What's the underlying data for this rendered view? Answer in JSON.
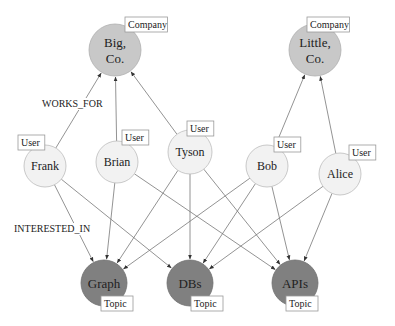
{
  "colors": {
    "company_fill": "#c8c8c8",
    "company_stroke": "#b0b0b0",
    "user_fill": "#f2f2f2",
    "user_stroke": "#bdbdbd",
    "topic_fill": "#808080",
    "topic_stroke": "#6e6e6e",
    "edge": "#777777"
  },
  "nodes": [
    {
      "id": "bigco",
      "lines": [
        "Big,",
        "Co."
      ],
      "type": "Company",
      "x": 115,
      "y": 50,
      "r": 26,
      "tag_x": 125,
      "tag_y": 17
    },
    {
      "id": "littleco",
      "lines": [
        "Little,",
        "Co."
      ],
      "type": "Company",
      "x": 315,
      "y": 50,
      "r": 26,
      "tag_x": 307,
      "tag_y": 17
    },
    {
      "id": "frank",
      "lines": [
        "Frank"
      ],
      "type": "User",
      "x": 45,
      "y": 166,
      "r": 21,
      "tag_x": 18,
      "tag_y": 135
    },
    {
      "id": "brian",
      "lines": [
        "Brian"
      ],
      "type": "User",
      "x": 117,
      "y": 162,
      "r": 21,
      "tag_x": 122,
      "tag_y": 130
    },
    {
      "id": "tyson",
      "lines": [
        "Tyson"
      ],
      "type": "User",
      "x": 190,
      "y": 152,
      "r": 22,
      "tag_x": 187,
      "tag_y": 121
    },
    {
      "id": "bob",
      "lines": [
        "Bob"
      ],
      "type": "User",
      "x": 267,
      "y": 166,
      "r": 21,
      "tag_x": 274,
      "tag_y": 137
    },
    {
      "id": "alice",
      "lines": [
        "Alice"
      ],
      "type": "User",
      "x": 340,
      "y": 174,
      "r": 21,
      "tag_x": 349,
      "tag_y": 145
    },
    {
      "id": "graph",
      "lines": [
        "Graph"
      ],
      "type": "Topic",
      "x": 104,
      "y": 283,
      "r": 23,
      "tag_x": 101,
      "tag_y": 296
    },
    {
      "id": "dbs",
      "lines": [
        "DBs"
      ],
      "type": "Topic",
      "x": 190,
      "y": 283,
      "r": 23,
      "tag_x": 191,
      "tag_y": 296
    },
    {
      "id": "apis",
      "lines": [
        "APIs"
      ],
      "type": "Topic",
      "x": 295,
      "y": 283,
      "r": 23,
      "tag_x": 286,
      "tag_y": 296
    }
  ],
  "edges": [
    {
      "from": "frank",
      "to": "bigco",
      "type": "WORKS_FOR"
    },
    {
      "from": "brian",
      "to": "bigco",
      "type": "WORKS_FOR"
    },
    {
      "from": "tyson",
      "to": "bigco",
      "type": "WORKS_FOR"
    },
    {
      "from": "bob",
      "to": "littleco",
      "type": "WORKS_FOR"
    },
    {
      "from": "alice",
      "to": "littleco",
      "type": "WORKS_FOR"
    },
    {
      "from": "frank",
      "to": "graph",
      "type": "INTERESTED_IN"
    },
    {
      "from": "frank",
      "to": "dbs",
      "type": "INTERESTED_IN"
    },
    {
      "from": "brian",
      "to": "graph",
      "type": "INTERESTED_IN"
    },
    {
      "from": "brian",
      "to": "apis",
      "type": "INTERESTED_IN"
    },
    {
      "from": "tyson",
      "to": "graph",
      "type": "INTERESTED_IN"
    },
    {
      "from": "tyson",
      "to": "dbs",
      "type": "INTERESTED_IN"
    },
    {
      "from": "tyson",
      "to": "apis",
      "type": "INTERESTED_IN"
    },
    {
      "from": "bob",
      "to": "graph",
      "type": "INTERESTED_IN"
    },
    {
      "from": "bob",
      "to": "dbs",
      "type": "INTERESTED_IN"
    },
    {
      "from": "bob",
      "to": "apis",
      "type": "INTERESTED_IN"
    },
    {
      "from": "alice",
      "to": "dbs",
      "type": "INTERESTED_IN"
    },
    {
      "from": "alice",
      "to": "apis",
      "type": "INTERESTED_IN"
    }
  ],
  "edge_labels": [
    {
      "text": "WORKS_FOR",
      "x": 42,
      "y": 107
    },
    {
      "text": "INTERESTED_IN",
      "x": 14,
      "y": 232
    }
  ]
}
